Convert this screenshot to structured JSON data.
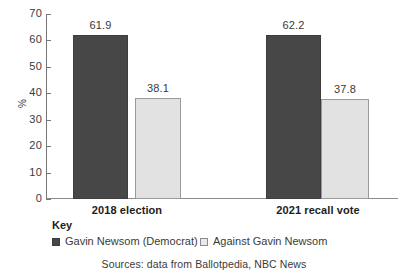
{
  "chart_data": {
    "type": "bar",
    "title": "",
    "xlabel": "",
    "ylabel": "%",
    "ylim": [
      0,
      70
    ],
    "ytick_step": 10,
    "yticks": [
      70,
      60,
      50,
      40,
      30,
      20,
      10,
      0
    ],
    "grid": false,
    "legend_position": "bottom-left",
    "categories": [
      "2018 election",
      "2021 recall vote"
    ],
    "series": [
      {
        "name": "Gavin Newsom (Democrat)",
        "color": "#474747",
        "values": [
          61.9,
          38.1
        ]
      },
      {
        "name": "Against Gavin Newsom",
        "color": "#e2e2e2",
        "values": [
          62.2,
          37.8
        ]
      }
    ],
    "bars": [
      {
        "group": "2018 election",
        "series": "Gavin Newsom (Democrat)",
        "value": 61.9,
        "label": "61.9",
        "style": "dark"
      },
      {
        "group": "2018 election",
        "series": "Against Gavin Newsom",
        "value": 38.1,
        "label": "38.1",
        "style": "light"
      },
      {
        "group": "2021 recall vote",
        "series": "Gavin Newsom (Democrat)",
        "value": 62.2,
        "label": "62.2",
        "style": "dark"
      },
      {
        "group": "2021 recall vote",
        "series": "Against Gavin Newsom",
        "value": 37.8,
        "label": "37.8",
        "style": "light"
      }
    ],
    "annotations": {
      "key_heading": "Key",
      "source": "Sources: data from Ballotpedia, NBC News"
    }
  }
}
